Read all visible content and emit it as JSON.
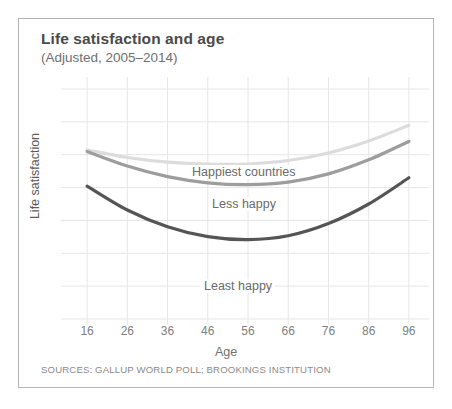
{
  "chart_data": {
    "type": "line",
    "title": "Life satisfaction and age",
    "subtitle": "(Adjusted, 2005–2014)",
    "xlabel": "Age",
    "ylabel": "Life satisfaction",
    "source": "SOURCES: GALLUP WORLD POLL; BROOKINGS INSTITUTION",
    "grid": true,
    "legend_position": "inline-annotations",
    "xlim": [
      11,
      101
    ],
    "ylim": [
      0,
      10
    ],
    "x_ticks": [
      16,
      26,
      36,
      46,
      56,
      66,
      76,
      86,
      96
    ],
    "y_ticks": [],
    "x": [
      16,
      26,
      36,
      46,
      56,
      66,
      76,
      86,
      96
    ],
    "series": [
      {
        "name": "Happiest countries",
        "color": "#dcdcdc",
        "values": [
          7.35,
          7.02,
          6.82,
          6.73,
          6.74,
          6.89,
          7.22,
          7.74,
          8.42
        ]
      },
      {
        "name": "Less happy",
        "color": "#9d9d9d",
        "values": [
          7.28,
          6.65,
          6.19,
          5.92,
          5.84,
          5.95,
          6.31,
          6.92,
          7.72
        ]
      },
      {
        "name": "Least happy",
        "color": "#555555",
        "values": [
          5.78,
          4.74,
          4.01,
          3.58,
          3.45,
          3.62,
          4.15,
          5.0,
          6.14
        ]
      }
    ],
    "annotations": [
      {
        "text": "Happiest countries",
        "x": 44,
        "y": 7.6
      },
      {
        "text": "Less happy",
        "x": 50,
        "y": 6.55
      },
      {
        "text": "Least happy",
        "x": 48,
        "y": 3.8
      }
    ]
  }
}
